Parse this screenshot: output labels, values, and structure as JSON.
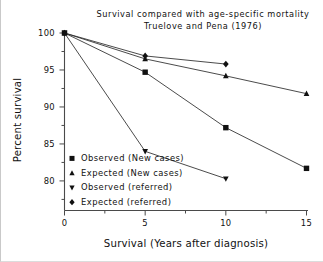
{
  "chart_data": {
    "type": "line",
    "title": "Survival compared with age-specific mortality",
    "subtitle": "Truelove and Pena (1976)",
    "xlabel": "Survival (Years after diagnosis)",
    "ylabel": "Percent survival",
    "xlim": [
      0,
      15
    ],
    "ylim": [
      76,
      100
    ],
    "grid": false,
    "legend_position": "inside-bottom-left",
    "xticks": [
      0,
      5,
      10,
      15
    ],
    "xtick_labels": [
      "0",
      "5",
      "10",
      "15"
    ],
    "xminor_ticks": [
      2.5,
      7.5,
      12.5
    ],
    "yticks": [
      100,
      95,
      90,
      85,
      80
    ],
    "ytick_labels": [
      "100",
      "95",
      "90",
      "85",
      "80"
    ],
    "yminor_ticks": [
      97.5,
      92.5,
      87.5,
      82.5,
      77.5
    ],
    "series": [
      {
        "name": "Observed (New cases)",
        "marker": "square",
        "x": [
          0,
          5,
          10,
          15
        ],
        "values": [
          100,
          94.7,
          87.2,
          81.7
        ]
      },
      {
        "name": "Expected (New cases)",
        "marker": "triangle-up",
        "x": [
          0,
          5,
          10,
          15
        ],
        "values": [
          100,
          96.5,
          94.2,
          91.8
        ]
      },
      {
        "name": "Observed (referred)",
        "marker": "triangle-down",
        "x": [
          0,
          5,
          10
        ],
        "values": [
          100,
          84.0,
          80.3
        ]
      },
      {
        "name": "Expected (referred)",
        "marker": "diamond",
        "x": [
          0,
          5,
          10
        ],
        "values": [
          100,
          96.9,
          95.8
        ]
      }
    ],
    "colors": {
      "line": "#2b2b2b",
      "marker": "#111111",
      "axis": "#4a4a4a",
      "text": "#111111",
      "background": "#ffffff"
    }
  },
  "legend": {
    "items": [
      {
        "label": "Observed (New cases)",
        "marker": "square"
      },
      {
        "label": "Expected (New cases)",
        "marker": "triangle-up"
      },
      {
        "label": "Observed (referred)",
        "marker": "triangle-down"
      },
      {
        "label": "Expected (referred)",
        "marker": "diamond"
      }
    ]
  }
}
